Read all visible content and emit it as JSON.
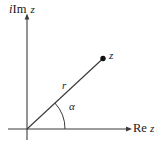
{
  "figure": {
    "type": "argand-diagram",
    "background_color": "#ffffff",
    "stroke_color": "#3b3b3b",
    "text_color": "#1a1a1a",
    "labels": {
      "imaginary_axis_i": "i",
      "imaginary_axis_im": "Im",
      "imaginary_axis_var": "z",
      "real_axis_re": "Re",
      "real_axis_var": "z",
      "point": "z",
      "radius": "r",
      "angle": "α"
    },
    "geometry": {
      "origin_x": 27,
      "origin_y": 129,
      "point_z_x": 103,
      "point_z_y": 58,
      "x_axis_start_x": 8,
      "x_axis_end_x": 131,
      "y_axis_top_y": 17,
      "y_axis_bottom_y": 140,
      "angle_arc_radius": 38,
      "angle_degrees": 43,
      "point_dot_radius": 2.6
    }
  }
}
